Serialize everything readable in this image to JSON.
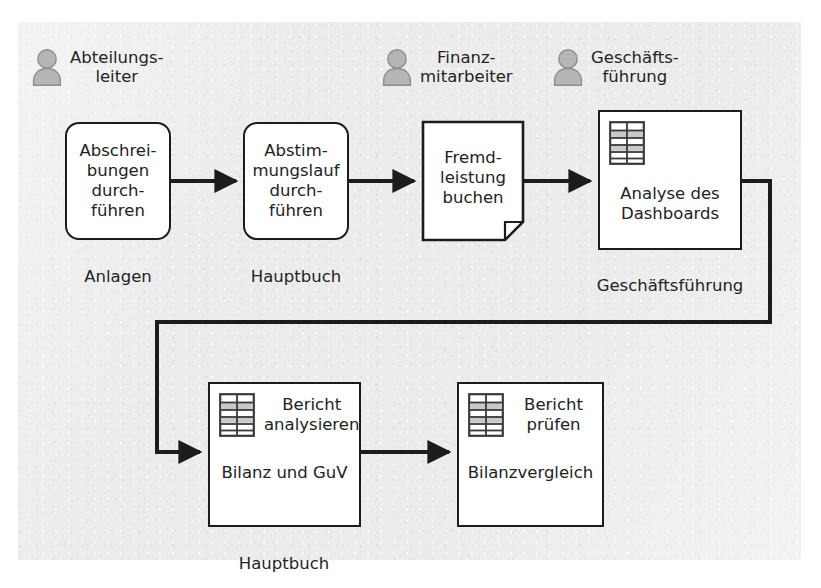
{
  "diagram": {
    "colors": {
      "paper": "#ececed",
      "stroke": "#1c1c1c",
      "node_fill": "#ffffff",
      "actor_fill": "#b5b5b5",
      "actor_stroke": "#8e8e8e",
      "text": "#222222"
    },
    "actors": [
      {
        "id": "actor-abteilungsleiter",
        "icon": "person-icon",
        "label": "Abteilungs-\nleiter"
      },
      {
        "id": "actor-finanzmitarbeiter",
        "icon": "person-icon",
        "label": "Finanz-\nmitarbeiter"
      },
      {
        "id": "actor-geschaeftsfuehrung",
        "icon": "person-icon",
        "label": "Geschäfts-\nführung"
      }
    ],
    "nodes": [
      {
        "id": "node-abschreibungen",
        "type": "activity",
        "text": "Abschrei-\nbungen\ndurch-\nführen",
        "caption": "Anlagen"
      },
      {
        "id": "node-abstimmungslauf",
        "type": "activity",
        "text": "Abstim-\nmungslauf\ndurch-\nführen",
        "caption": "Hauptbuch"
      },
      {
        "id": "node-fremdleistung",
        "type": "document",
        "text": "Fremd-\nleistung\nbuchen",
        "caption": ""
      },
      {
        "id": "node-analyse-dashboard",
        "type": "report",
        "icon": "table-grid-icon",
        "title": "",
        "subtitle": "Analyse des\nDashboards",
        "caption": "Geschäftsführung"
      },
      {
        "id": "node-bericht-analysieren",
        "type": "report",
        "icon": "table-grid-icon",
        "title": "Bericht\nanalysieren",
        "subtitle": "Bilanz und GuV",
        "caption": "Hauptbuch"
      },
      {
        "id": "node-bericht-pruefen",
        "type": "report",
        "icon": "table-grid-icon",
        "title": "Bericht\nprüfen",
        "subtitle": "Bilanzvergleich",
        "caption": ""
      }
    ],
    "connectors": [
      {
        "id": "arrow-1",
        "from": "node-abschreibungen",
        "to": "node-abstimmungslauf",
        "style": "straight"
      },
      {
        "id": "arrow-2",
        "from": "node-abstimmungslauf",
        "to": "node-fremdleistung",
        "style": "straight"
      },
      {
        "id": "arrow-3",
        "from": "node-fremdleistung",
        "to": "node-analyse-dashboard",
        "style": "straight"
      },
      {
        "id": "arrow-4",
        "from": "node-analyse-dashboard",
        "to": "node-bericht-analysieren",
        "style": "orthogonal-wrap"
      },
      {
        "id": "arrow-5",
        "from": "node-bericht-analysieren",
        "to": "node-bericht-pruefen",
        "style": "straight"
      }
    ]
  }
}
